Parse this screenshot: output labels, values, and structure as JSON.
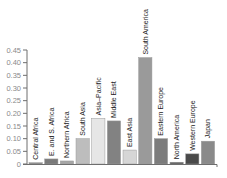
{
  "chart_data": {
    "type": "bar",
    "title": "",
    "xlabel": "",
    "ylabel": "",
    "ylim": [
      0,
      0.45
    ],
    "yticks": [
      "0",
      "0.05",
      "0.10",
      "0.15",
      "0.20",
      "0.25",
      "0.30",
      "0.35",
      "0.40",
      "0.45"
    ],
    "grid": false,
    "legend": null,
    "categories": [
      "Central Africa",
      "E. and S. Africa",
      "Northern Africa",
      "South Asia",
      "Asia–Pacific",
      "Middle East",
      "East Asia",
      "South America",
      "Eastern Europe",
      "North America",
      "Western Europe",
      "Japan"
    ],
    "values": [
      0.005,
      0.02,
      0.012,
      0.1,
      0.18,
      0.17,
      0.055,
      0.42,
      0.1,
      0.007,
      0.04,
      0.09
    ],
    "bar_colors": [
      "#8c8c8c",
      "#7a7a7a",
      "#a6a6a6",
      "#bdbdbd",
      "#e6e6e6",
      "#828282",
      "#d6d6d6",
      "#9a9a9a",
      "#7c7c7c",
      "#5a5a5a",
      "#4a4a4a",
      "#8a8a8a"
    ]
  },
  "axis": {
    "color": "#6e6e6e"
  }
}
